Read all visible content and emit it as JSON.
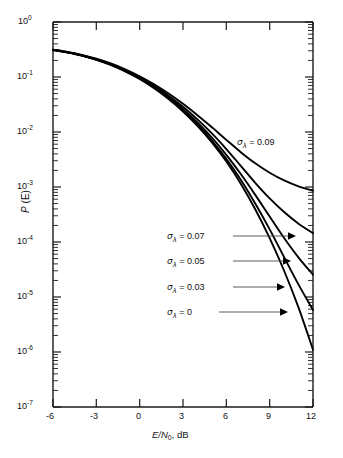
{
  "chart_data": {
    "type": "line",
    "title": "",
    "subtitle": "",
    "xlabel": "E/N0, dB",
    "ylabel": "P (E)",
    "xscale": "linear",
    "yscale": "log",
    "xlim": [
      -6,
      12
    ],
    "ylim": [
      1e-07,
      1
    ],
    "grid": false,
    "legend_position": "inline-annotations",
    "x_ticks": [
      "-6",
      "-3",
      "0",
      "3",
      "6",
      "9",
      "12"
    ],
    "x_tick_values": [
      -6,
      -3,
      0,
      3,
      6,
      9,
      12
    ],
    "y_ticks": [
      "10^0",
      "10^-1",
      "10^-2",
      "10^-3",
      "10^-4",
      "10^-5",
      "10^-6",
      "10^-7"
    ],
    "y_tick_exponents": [
      0,
      -1,
      -2,
      -3,
      -4,
      -5,
      -6,
      -7
    ],
    "x": [
      -6,
      -5,
      -4,
      -3,
      -2,
      -1,
      0,
      1,
      2,
      3,
      4,
      5,
      6,
      7,
      8,
      9,
      10,
      11,
      12
    ],
    "series": [
      {
        "name": "sigma_lambda = 0.09",
        "label_sigma": "σ",
        "label_sub": "λ",
        "label_value": "0.09",
        "values": [
          0.315,
          0.285,
          0.252,
          0.215,
          0.176,
          0.138,
          0.103,
          0.0735,
          0.05,
          0.0325,
          0.0202,
          0.0122,
          0.0072,
          0.0043,
          0.0027,
          0.00182,
          0.00132,
          0.00103,
          0.00086
        ]
      },
      {
        "name": "sigma_lambda = 0.07",
        "label_sigma": "σ",
        "label_sub": "λ",
        "label_value": "0.07",
        "values": [
          0.313,
          0.283,
          0.249,
          0.211,
          0.172,
          0.133,
          0.0985,
          0.069,
          0.0458,
          0.0288,
          0.017,
          0.00945,
          0.0049,
          0.00242,
          0.00119,
          0.00062,
          0.00035,
          0.000215,
          0.000145
        ]
      },
      {
        "name": "sigma_lambda = 0.05",
        "label_sigma": "σ",
        "label_sub": "λ",
        "label_value": "0.05",
        "values": [
          0.312,
          0.281,
          0.247,
          0.209,
          0.169,
          0.13,
          0.0952,
          0.0658,
          0.0428,
          0.0262,
          0.0149,
          0.0079,
          0.00385,
          0.00172,
          0.00072,
          0.00029,
          0.000118,
          5.2e-05,
          2.55e-05
        ]
      },
      {
        "name": "sigma_lambda = 0.03",
        "label_sigma": "σ",
        "label_sub": "λ",
        "label_value": "0.03",
        "values": [
          0.311,
          0.28,
          0.246,
          0.207,
          0.167,
          0.128,
          0.0932,
          0.0638,
          0.041,
          0.0246,
          0.0137,
          0.007,
          0.00325,
          0.00135,
          0.0005,
          0.00017,
          5.3e-05,
          1.68e-05,
          5.8e-06
        ]
      },
      {
        "name": "sigma_lambda = 0",
        "label_sigma": "σ",
        "label_sub": "λ",
        "label_value": "0",
        "values": [
          0.31,
          0.279,
          0.245,
          0.206,
          0.166,
          0.127,
          0.092,
          0.0625,
          0.0398,
          0.0236,
          0.0129,
          0.00645,
          0.0029,
          0.00115,
          0.000395,
          0.000118,
          3e-05,
          6.4e-06,
          1.1e-06
        ]
      }
    ],
    "annotations": [
      {
        "text": "σλ = 0.09",
        "x": 8.2,
        "y": 0.0035,
        "has_leader": false
      },
      {
        "text": "σλ = 0.07",
        "x": 6.1,
        "y": 0.00011,
        "has_leader": true
      },
      {
        "text": "σλ = 0.05",
        "x": 6.1,
        "y": 4.2e-05,
        "has_leader": true
      },
      {
        "text": "σλ = 0.03",
        "x": 6.1,
        "y": 1.65e-05,
        "has_leader": true
      },
      {
        "text": "σλ = 0",
        "x": 6.1,
        "y": 6.2e-06,
        "has_leader": true
      }
    ]
  },
  "axes": {
    "y_tick_labels": [
      {
        "mantissa": "10",
        "exp": "0"
      },
      {
        "mantissa": "10",
        "exp": "-1"
      },
      {
        "mantissa": "10",
        "exp": "-2"
      },
      {
        "mantissa": "10",
        "exp": "-3"
      },
      {
        "mantissa": "10",
        "exp": "-4"
      },
      {
        "mantissa": "10",
        "exp": "-5"
      },
      {
        "mantissa": "10",
        "exp": "-6"
      },
      {
        "mantissa": "10",
        "exp": "-7"
      }
    ],
    "x_tick_labels": [
      "-6",
      "-3",
      "0",
      "3",
      "6",
      "9",
      "12"
    ],
    "x_axis_title_main": "E/N",
    "x_axis_title_sub": "0",
    "x_axis_title_tail": ", dB",
    "y_axis_title_main": "P",
    "y_axis_title_tail": " (E)"
  },
  "colors": {
    "curve": "#000000",
    "axis": "#1a1a1a",
    "leader": "#4a4a4a",
    "background": "#ffffff"
  }
}
